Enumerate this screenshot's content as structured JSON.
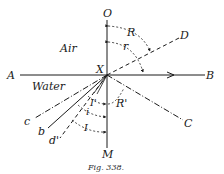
{
  "figure": {
    "caption": "Fig. 338.",
    "media_labels": {
      "upper": "Air",
      "lower": "Water"
    },
    "points": {
      "O": "O",
      "M": "M",
      "A": "A",
      "B": "B",
      "X": "X",
      "D": "D",
      "C": "C",
      "c": "c",
      "b": "b",
      "d_prime": "d'"
    },
    "angles": {
      "R": "R",
      "r": "r",
      "R_prime": "R'",
      "I_prime": "I'",
      "i": "i",
      "I": "I"
    }
  },
  "colors": {
    "ink": "#1a1a1a",
    "background": "#ffffff"
  }
}
